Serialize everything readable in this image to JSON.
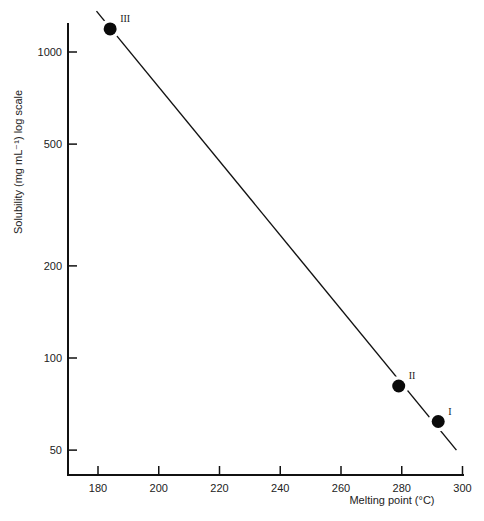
{
  "chart_data": {
    "type": "scatter",
    "title": "",
    "xlabel": "Melting point (°C)",
    "ylabel": "Solubility (mg mL⁻¹) log scale",
    "x_ticks": [
      180,
      200,
      220,
      240,
      260,
      280,
      300
    ],
    "y_ticks": [
      50,
      100,
      200,
      500,
      1000
    ],
    "y_scale": "log",
    "xlim": [
      171,
      301
    ],
    "ylim": [
      40,
      1500
    ],
    "grid": false,
    "legend": null,
    "series": [
      {
        "name": "Polymorphs",
        "points": [
          {
            "label": "III",
            "x": 184,
            "y": 1190
          },
          {
            "label": "II",
            "x": 279,
            "y": 81
          },
          {
            "label": "I",
            "x": 292,
            "y": 62
          }
        ]
      }
    ],
    "fit_line": {
      "x_start": 179.5,
      "y_start": 1360,
      "x_end": 298,
      "y_end": 50
    }
  },
  "labels": {
    "xlabel": "Melting point (°C)",
    "ylabel": "Solubility (mg mL⁻¹) log scale"
  }
}
